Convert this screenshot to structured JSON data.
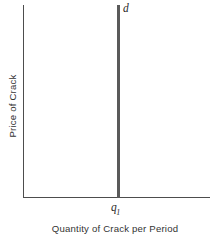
{
  "chart_data": {
    "type": "line",
    "title": "",
    "subtitle": "",
    "xlabel": "Quantity of Crack per Period",
    "ylabel": "Price of Crack",
    "grid": false,
    "legend": "none",
    "axis_style": "open-L",
    "xlim": [
      0,
      1
    ],
    "ylim": [
      0,
      1
    ],
    "x_tick_labels": [
      "q1"
    ],
    "y_tick_labels": [],
    "series": [
      {
        "name": "d",
        "label": "d",
        "description": "perfectly inelastic demand: vertical line at quantity q1",
        "x": [
          0.5,
          0.5
        ],
        "y": [
          0,
          1
        ]
      }
    ],
    "annotations": [
      {
        "text": "d",
        "x": 0.53,
        "y": 0.99
      },
      {
        "text": "q1",
        "x": 0.5,
        "y": -0.05
      }
    ],
    "colors": {
      "axis": "#4d4d4d",
      "curve": "#5a5a5a",
      "text": "#333333",
      "label_text": "#2b2b2b",
      "background": "#ffffff"
    }
  },
  "figure": {
    "curve_label": "d",
    "x_tick": {
      "base": "q",
      "subscript": "1"
    },
    "x_axis_title": "Quantity of Crack per Period",
    "y_axis_title": "Price of Crack"
  }
}
